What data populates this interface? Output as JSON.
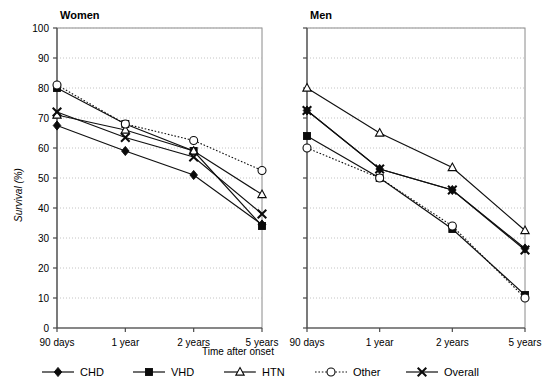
{
  "figure": {
    "panels": [
      {
        "key": "women",
        "title": "Women"
      },
      {
        "key": "men",
        "title": "Men"
      }
    ],
    "axis": {
      "ylabel": "Survival (%)",
      "xlabel": "Time after onset",
      "yticks": [
        "0",
        "10",
        "20",
        "30",
        "40",
        "50",
        "60",
        "70",
        "80",
        "90",
        "100"
      ],
      "xticks": [
        "90 days",
        "1 year",
        "2 years",
        "5 years"
      ]
    },
    "legend": {
      "items": [
        {
          "label": "CHD",
          "marker": "filled-diamond",
          "line": "solid",
          "color": "#0b0b0b"
        },
        {
          "label": "VHD",
          "marker": "filled-square",
          "line": "solid",
          "color": "#0b0b0b"
        },
        {
          "label": "HTN",
          "marker": "open-triangle",
          "line": "solid",
          "color": "#0b0b0b"
        },
        {
          "label": "Other",
          "marker": "open-circle",
          "line": "dotted",
          "color": "#0b0b0b"
        },
        {
          "label": "Overall",
          "marker": "cross-x",
          "line": "solid",
          "color": "#0b0b0b"
        }
      ]
    }
  },
  "chart_data": {
    "type": "line",
    "title": "",
    "xlabel": "Time after onset",
    "ylabel": "Survival (%)",
    "ylim": [
      0,
      100
    ],
    "ytick_step": 10,
    "grid": true,
    "legend_position": "bottom",
    "categories": [
      "90 days",
      "1 year",
      "2 years",
      "5 years"
    ],
    "panels": [
      {
        "name": "Women",
        "series": [
          {
            "name": "CHD",
            "marker": "filled-diamond",
            "line": "solid",
            "values": [
              67.5,
              59.0,
              51.0,
              34.5
            ]
          },
          {
            "name": "VHD",
            "marker": "filled-square",
            "line": "solid",
            "values": [
              80.0,
              68.0,
              59.0,
              34.0
            ]
          },
          {
            "name": "HTN",
            "marker": "open-triangle",
            "line": "solid",
            "values": [
              71.0,
              66.0,
              59.0,
              44.5
            ]
          },
          {
            "name": "Other",
            "marker": "open-circle",
            "line": "dotted",
            "values": [
              81.0,
              68.0,
              62.5,
              52.5
            ]
          },
          {
            "name": "Overall",
            "marker": "cross-x",
            "line": "solid",
            "values": [
              72.0,
              63.5,
              57.0,
              38.0
            ]
          }
        ]
      },
      {
        "name": "Men",
        "series": [
          {
            "name": "CHD",
            "marker": "filled-diamond",
            "line": "solid",
            "values": [
              72.5,
              53.0,
              46.0,
              26.5
            ]
          },
          {
            "name": "VHD",
            "marker": "filled-square",
            "line": "solid",
            "values": [
              64.0,
              50.0,
              33.0,
              11.0
            ]
          },
          {
            "name": "HTN",
            "marker": "open-triangle",
            "line": "solid",
            "values": [
              80.0,
              65.0,
              53.5,
              32.5
            ]
          },
          {
            "name": "Other",
            "marker": "open-circle",
            "line": "dotted",
            "values": [
              60.0,
              50.0,
              34.0,
              10.0
            ]
          },
          {
            "name": "Overall",
            "marker": "cross-x",
            "line": "solid",
            "values": [
              72.5,
              53.0,
              46.0,
              26.0
            ]
          }
        ]
      }
    ]
  }
}
